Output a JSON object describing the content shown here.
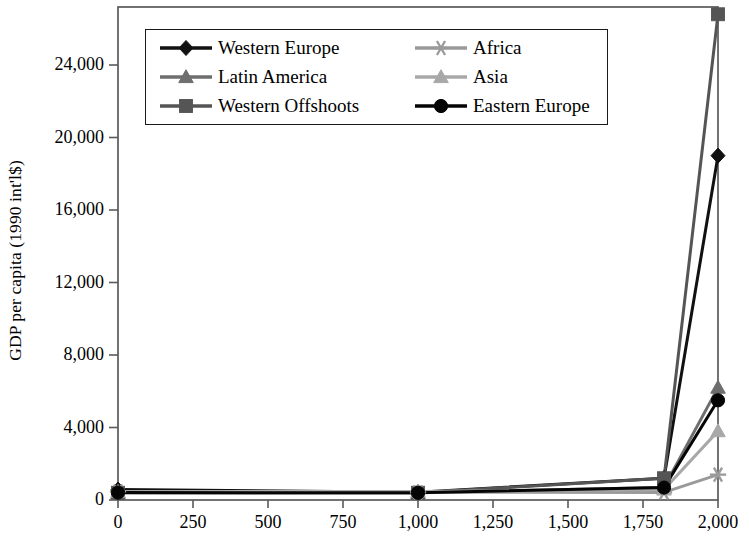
{
  "chart_data": {
    "type": "line",
    "title": "",
    "xlabel": "",
    "ylabel": "GDP per capita (1990 int'l$)",
    "x": [
      0,
      1000,
      1820,
      2000
    ],
    "xlim": [
      0,
      2000
    ],
    "ylim": [
      0,
      27000
    ],
    "xticks": [
      0,
      250,
      500,
      750,
      1000,
      1250,
      1500,
      1750,
      2000
    ],
    "xtick_labels": [
      "0",
      "250",
      "500",
      "750",
      "1,000",
      "1,250",
      "1,500",
      "1,750",
      "2,000"
    ],
    "yticks": [
      0,
      4000,
      8000,
      12000,
      16000,
      20000,
      24000
    ],
    "ytick_labels": [
      "0",
      "4,000",
      "8,000",
      "12,000",
      "16,000",
      "20,000",
      "24,000"
    ],
    "grid": false,
    "legend_position": "upper-left-inside",
    "series": [
      {
        "name": "Western Europe",
        "marker": "diamond",
        "color": "#111111",
        "values": [
          576,
          427,
          1204,
          19000
        ]
      },
      {
        "name": "Latin America",
        "marker": "triangle",
        "color": "#6e6e6e",
        "values": [
          400,
          400,
          692,
          6200
        ]
      },
      {
        "name": "Western Offshoots",
        "marker": "square",
        "color": "#555555",
        "values": [
          400,
          400,
          1201,
          26800
        ]
      },
      {
        "name": "Africa",
        "marker": "asterisk",
        "color": "#9a9a9a",
        "values": [
          472,
          425,
          420,
          1400
        ]
      },
      {
        "name": "Asia",
        "marker": "triangle",
        "color": "#a8a8a8",
        "values": [
          456,
          470,
          581,
          3800
        ]
      },
      {
        "name": "Eastern Europe",
        "marker": "circle",
        "color": "#050505",
        "values": [
          412,
          400,
          683,
          5500
        ]
      }
    ]
  },
  "axis": {
    "frame_color": "#5a5a5a"
  }
}
